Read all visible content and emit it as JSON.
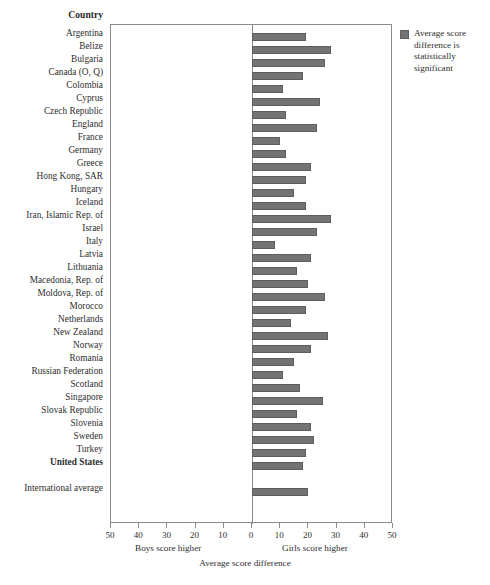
{
  "header": {
    "country_column_title": "Country"
  },
  "legend": {
    "swatch_color": "#737373",
    "text": "Average score difference is statistically significant"
  },
  "axis": {
    "title": "Average score difference",
    "left_caption": "Boys score higher",
    "right_caption": "Girls score higher",
    "tick_labels": [
      "50",
      "40",
      "30",
      "20",
      "10",
      "0",
      "10",
      "20",
      "30",
      "40",
      "50"
    ],
    "tick_values": [
      -50,
      -40,
      -30,
      -20,
      -10,
      0,
      10,
      20,
      30,
      40,
      50
    ]
  },
  "chart_data": {
    "type": "bar",
    "orientation": "horizontal",
    "title": "Average score difference",
    "xlabel": "Average score difference",
    "ylabel": "Country",
    "xlim": [
      -50,
      50
    ],
    "grid": false,
    "legend_position": "top-right",
    "legend_entries": [
      "Average score difference is statistically significant"
    ],
    "annotations": [
      "Boys score higher",
      "Girls score higher"
    ],
    "note": "Positive values indicate girls score higher; all displayed bars are statistically significant.",
    "categories": [
      "Argentina",
      "Belize",
      "Bulgaria",
      "Canada (O, Q)",
      "Colombia",
      "Cyprus",
      "Czech Republic",
      "England",
      "France",
      "Germany",
      "Greece",
      "Hong Kong, SAR",
      "Hungary",
      "Iceland",
      "Iran, Islamic Rep. of",
      "Israel",
      "Italy",
      "Latvia",
      "Lithuania",
      "Macedonia, Rep. of",
      "Moldova, Rep. of",
      "Morocco",
      "Netherlands",
      "New Zealand",
      "Norway",
      "Romania",
      "Russian Federation",
      "Scotland",
      "Singapore",
      "Slovak Republic",
      "Slovenia",
      "Sweden",
      "Turkey",
      "United States",
      "International average"
    ],
    "values": [
      19,
      28,
      26,
      18,
      11,
      24,
      12,
      23,
      10,
      12,
      21,
      19,
      15,
      19,
      28,
      23,
      8,
      21,
      16,
      20,
      26,
      19,
      14,
      27,
      21,
      15,
      11,
      17,
      25,
      16,
      21,
      22,
      19,
      18,
      20
    ],
    "bold_categories": [
      "United States"
    ],
    "separated_categories": [
      "International average"
    ]
  },
  "layout": {
    "plot_left_px": 110,
    "plot_top_px": 24,
    "plot_width_px": 282,
    "plot_height_px": 499,
    "zero_x_px": 251,
    "px_per_unit": 2.82,
    "row_step_px": 13.0,
    "first_row_center_px": 36,
    "gap_before_international_px": 13
  }
}
